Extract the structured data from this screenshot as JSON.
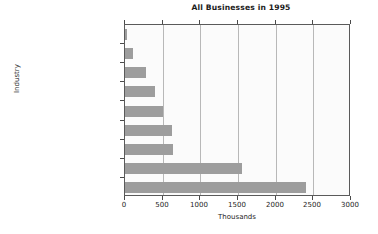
{
  "chart_data": {
    "type": "bar",
    "orientation": "horizontal",
    "title": "All Businesses in 1995",
    "xlabel": "Thousands",
    "ylabel": "Industry",
    "categories": [
      "Mining",
      "Agriculture",
      "Transportation",
      "Manufacturing",
      "Wholesale trade",
      "Finance and insurance",
      "Construction",
      "Retail trade",
      "Services"
    ],
    "values": [
      30,
      110,
      280,
      400,
      510,
      630,
      635,
      1550,
      2400
    ],
    "xlim": [
      0,
      3000
    ],
    "xticks": [
      0,
      500,
      1000,
      1500,
      2000,
      2500,
      3000
    ],
    "xtick_labels": [
      "0",
      "500",
      "1000",
      "1500",
      "2000",
      "2500",
      "3000"
    ],
    "grid": "vertical",
    "legend": "none",
    "bar_color": "#9d9d9d",
    "plot_background": "#fbfbfb",
    "frame_color": "#5a5a5a",
    "gridline_color": "#b8b8b8",
    "text_color": "#1d1d1d"
  }
}
